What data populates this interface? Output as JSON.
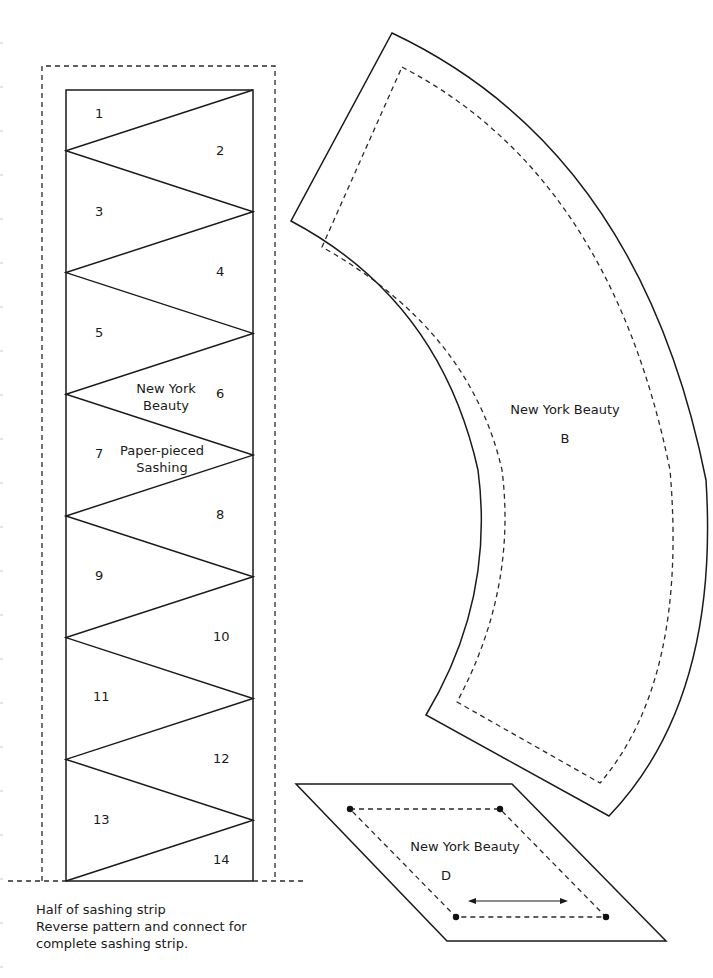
{
  "diagram": {
    "colors": {
      "line": "#1a1a1a",
      "dash": "#2a2a2a",
      "background": "#ffffff"
    },
    "sashing_strip": {
      "section_numbers": [
        "1",
        "2",
        "3",
        "4",
        "5",
        "6",
        "7",
        "8",
        "9",
        "10",
        "11",
        "12",
        "13",
        "14"
      ],
      "title_line1": "New York",
      "title_line2": "Beauty",
      "subtitle_line1": "Paper-pieced",
      "subtitle_line2": "Sashing",
      "caption": [
        "Half of sashing strip",
        "Reverse pattern and connect for",
        "complete sashing strip."
      ]
    },
    "piece_b": {
      "title": "New York Beauty",
      "letter": "B"
    },
    "piece_d": {
      "title": "New York Beauty",
      "letter": "D",
      "grain_arrow": "double-headed horizontal arrow"
    }
  }
}
